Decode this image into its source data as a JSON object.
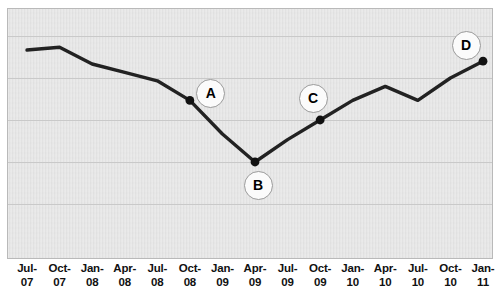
{
  "chart_data": {
    "type": "line",
    "title": "",
    "subtitle": "",
    "xlabel": "",
    "ylabel": "",
    "grid": true,
    "legend": false,
    "legend_position": "none",
    "axis_tick_labels_visible": {
      "x": true,
      "y": false
    },
    "categories": [
      "Jul-07",
      "Oct-07",
      "Jan-08",
      "Apr-08",
      "Jul-08",
      "Oct-08",
      "Jan-09",
      "Apr-09",
      "Jul-09",
      "Oct-09",
      "Jan-10",
      "Apr-10",
      "Jul-10",
      "Oct-10",
      "Jan-11"
    ],
    "category_lines": [
      [
        "Jul-",
        "07"
      ],
      [
        "Oct-",
        "07"
      ],
      [
        "Jan-",
        "08"
      ],
      [
        "Apr-",
        "08"
      ],
      [
        "Jul-",
        "08"
      ],
      [
        "Oct-",
        "08"
      ],
      [
        "Jan-",
        "09"
      ],
      [
        "Apr-",
        "09"
      ],
      [
        "Jul-",
        "09"
      ],
      [
        "Oct-",
        "09"
      ],
      [
        "Jan-",
        "10"
      ],
      [
        "Apr-",
        "10"
      ],
      [
        "Jul-",
        "10"
      ],
      [
        "Oct-",
        "10"
      ],
      [
        "Jan-",
        "11"
      ]
    ],
    "series": [
      {
        "name": "series-1",
        "color": "#222222",
        "values": [
          90,
          91,
          85,
          82,
          79,
          72,
          60,
          50,
          58,
          65,
          72,
          77,
          72,
          80,
          86
        ]
      }
    ],
    "ylim": [
      20,
      100
    ],
    "y_gridline_values": [
      95,
      80,
      65,
      50,
      35
    ],
    "annotations": [
      {
        "label": "A",
        "category": "Oct-08",
        "value": 72,
        "badge_dx": 20,
        "badge_dy": -8
      },
      {
        "label": "B",
        "category": "Apr-09",
        "value": 50,
        "badge_dx": 2,
        "badge_dy": 22
      },
      {
        "label": "C",
        "category": "Oct-09",
        "value": 65,
        "badge_dx": -8,
        "badge_dy": -23
      },
      {
        "label": "D",
        "category": "Jan-11",
        "value": 86,
        "badge_dx": -18,
        "badge_dy": -17
      }
    ],
    "colors": {
      "plot_background": "#e2e2e2",
      "plot_border": "#b9b9b9",
      "gridline": "#c9c9c9",
      "line": "#222222",
      "marker": "#111111",
      "badge_fill": "#fbfbfb",
      "badge_border": "#9a9a9a",
      "tick_label": "#111111",
      "page_background": "#ffffff"
    }
  }
}
